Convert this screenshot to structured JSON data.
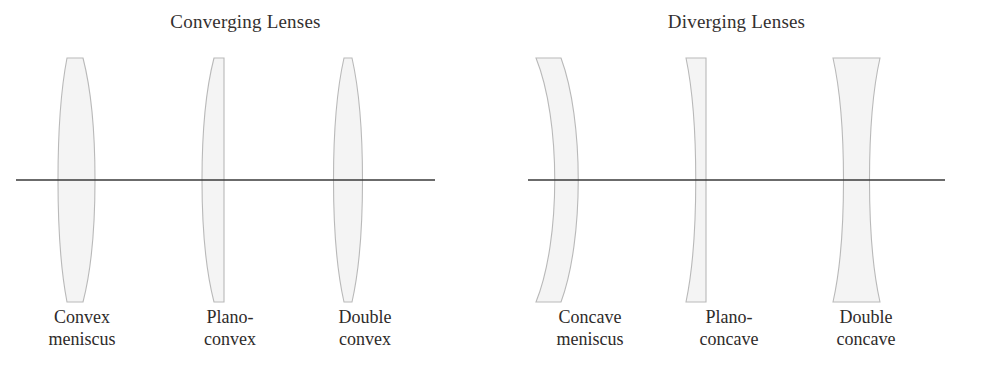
{
  "figure": {
    "background_color": "#ffffff",
    "outline_color": "#b9b9b9",
    "fill_color": "#f4f4f4",
    "axis_color": "#3a3a3a",
    "text_color": "#2e2b2a"
  },
  "panels": [
    {
      "heading": "Converging Lenses",
      "axis_label": "optical-axis",
      "lenses": [
        {
          "name": "convex-meniscus",
          "label_line1": "Convex",
          "label_line2": "meniscus",
          "shape": "meniscus",
          "left_surface": "concave",
          "right_surface": "convex",
          "thicker_at": "center"
        },
        {
          "name": "plano-convex",
          "label_line1": "Plano-",
          "label_line2": "convex",
          "shape": "plano",
          "left_surface": "convex",
          "right_surface": "flat",
          "thicker_at": "center"
        },
        {
          "name": "double-convex",
          "label_line1": "Double",
          "label_line2": "convex",
          "shape": "biconvex",
          "left_surface": "convex",
          "right_surface": "convex",
          "thicker_at": "center"
        }
      ]
    },
    {
      "heading": "Diverging Lenses",
      "axis_label": "optical-axis",
      "lenses": [
        {
          "name": "concave-meniscus",
          "label_line1": "Concave",
          "label_line2": "meniscus",
          "shape": "meniscus",
          "left_surface": "concave",
          "right_surface": "convex",
          "thicker_at": "edges"
        },
        {
          "name": "plano-concave",
          "label_line1": "Plano-",
          "label_line2": "concave",
          "shape": "plano",
          "left_surface": "concave",
          "right_surface": "flat",
          "thicker_at": "edges"
        },
        {
          "name": "double-concave",
          "label_line1": "Double",
          "label_line2": "concave",
          "shape": "biconcave",
          "left_surface": "concave",
          "right_surface": "concave",
          "thicker_at": "edges"
        }
      ]
    }
  ]
}
